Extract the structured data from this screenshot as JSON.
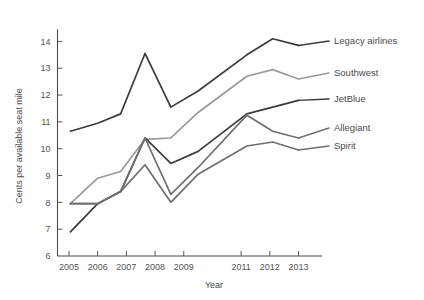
{
  "chart_data": {
    "type": "line",
    "title": "",
    "xlabel": "Year",
    "ylabel": "Cents per available seat mile",
    "xlim": [
      2004.6,
      2013.4
    ],
    "ylim": [
      6,
      14.5
    ],
    "grid": false,
    "legend_position": "right-inline-labels",
    "x_tick_labels": [
      "2005",
      "2006",
      "2007",
      "2008",
      "2009",
      "2011",
      "2012",
      "2013"
    ],
    "x_tick_values": [
      2005,
      2006,
      2007,
      2008,
      2009,
      2011,
      2012,
      2013
    ],
    "y_tick_labels": [
      "6",
      "7",
      "8",
      "9",
      "10",
      "11",
      "12",
      "13",
      "14"
    ],
    "y_tick_values": [
      6,
      7,
      8,
      9,
      10,
      11,
      12,
      13,
      14
    ],
    "x": [
      2005.05,
      2006.0,
      2006.8,
      2007.65,
      2008.55,
      2009.5,
      2011.2,
      2012.1,
      2013.0
    ],
    "series": [
      {
        "name": "Legacy airlines",
        "color": "#3b3b3b",
        "values": [
          10.65,
          10.95,
          11.3,
          13.55,
          11.55,
          12.15,
          13.5,
          14.1,
          13.85
        ]
      },
      {
        "name": "Southwest",
        "color": "#9a9a9a",
        "values": [
          7.95,
          8.9,
          9.15,
          10.35,
          10.4,
          11.35,
          12.7,
          12.95,
          12.6
        ]
      },
      {
        "name": "JetBlue",
        "color": "#3b3b3b",
        "values": [
          6.9,
          7.95,
          8.4,
          10.4,
          9.45,
          9.9,
          11.3,
          11.55,
          11.8
        ]
      },
      {
        "name": "Allegiant",
        "color": "#6f6f6f",
        "values": [
          7.95,
          7.95,
          8.4,
          10.4,
          8.3,
          9.3,
          11.25,
          10.65,
          10.4
        ]
      },
      {
        "name": "Spirit",
        "color": "#6f6f6f",
        "values": [
          7.95,
          7.95,
          8.4,
          9.4,
          8.0,
          9.05,
          10.1,
          10.25,
          9.95
        ]
      }
    ],
    "series_labels": [
      {
        "text": "Legacy airlines",
        "color": "#3b3b3b"
      },
      {
        "text": "Southwest",
        "color": "#9a9a9a"
      },
      {
        "text": "JetBlue",
        "color": "#3b3b3b"
      },
      {
        "text": "Allegiant",
        "color": "#6f6f6f"
      },
      {
        "text": "Spirit",
        "color": "#6f6f6f"
      }
    ]
  }
}
